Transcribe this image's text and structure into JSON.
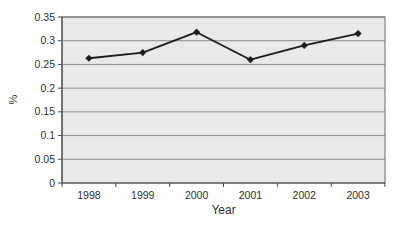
{
  "chart_data": {
    "type": "line",
    "xlabel": "Year",
    "ylabel": "%",
    "categories": [
      "1998",
      "1999",
      "2000",
      "2001",
      "2002",
      "2003"
    ],
    "series": [
      {
        "name": "percent-by-year",
        "values": [
          0.263,
          0.275,
          0.318,
          0.26,
          0.29,
          0.315
        ]
      }
    ],
    "ylim": [
      0,
      0.35
    ],
    "ytick_step": 0.05,
    "ytick_labels": [
      "0",
      "0.05",
      "0.1",
      "0.15",
      "0.2",
      "0.25",
      "0.3",
      "0.35"
    ],
    "grid": "horizontal",
    "legend": "none",
    "marker": "diamond",
    "colors": {
      "line": "#1c1c1c",
      "marker": "#1c1c1c",
      "plot_bg": "#e9e9e9",
      "grid": "#8c8c8c",
      "plot_border": "#6b6b6b",
      "axis": "#4a4a4a",
      "text": "#2e2e2e",
      "page_bg": "#ffffff"
    }
  }
}
